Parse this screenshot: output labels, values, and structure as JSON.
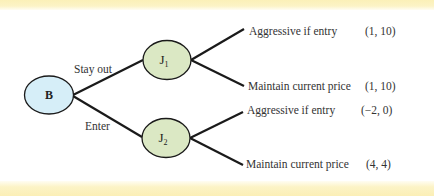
{
  "diagram": {
    "type": "game-tree",
    "colors": {
      "root_fill": "#d6eef8",
      "decision_fill": "#dbe8c4",
      "stroke": "#1a1a1a",
      "band": "#fcf1bf"
    },
    "root": {
      "id": "B",
      "label": "B"
    },
    "decision_nodes": [
      {
        "id": "J1",
        "label": "J",
        "subscript": "1",
        "via": "Stay out"
      },
      {
        "id": "J2",
        "label": "J",
        "subscript": "2",
        "via": "Enter"
      }
    ],
    "branches": [
      {
        "from": "B",
        "to": "J1",
        "label": "Stay out"
      },
      {
        "from": "B",
        "to": "J2",
        "label": "Enter"
      }
    ],
    "leaves": [
      {
        "from": "J1",
        "action": "Aggressive if entry",
        "payoff": "(1, 10)"
      },
      {
        "from": "J1",
        "action": "Maintain current price",
        "payoff": "(1, 10)"
      },
      {
        "from": "J2",
        "action": "Aggressive if entry",
        "payoff": "(−2, 0)"
      },
      {
        "from": "J2",
        "action": "Maintain current price",
        "payoff": "(4, 4)"
      }
    ]
  }
}
